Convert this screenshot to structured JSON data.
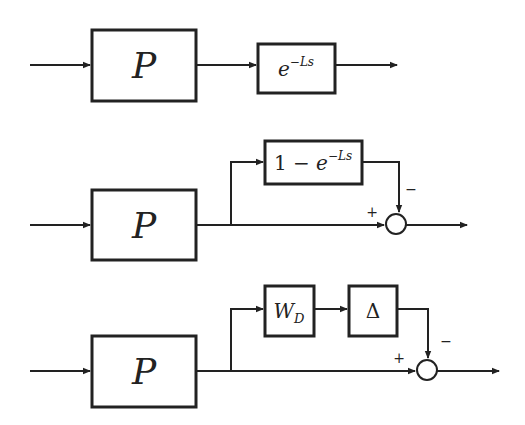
{
  "diagram": {
    "title": "",
    "rows": [
      {
        "name": "delay-model",
        "blocks": [
          {
            "id": "plant",
            "label": "P"
          },
          {
            "id": "delay",
            "label_base": "e",
            "label_sup": "−Ls"
          }
        ]
      },
      {
        "name": "additive-delay-model",
        "blocks": [
          {
            "id": "plant",
            "label": "P"
          },
          {
            "id": "delay-diff",
            "label_prefix": "1 − ",
            "label_base": "e",
            "label_sup": "−Ls"
          }
        ],
        "sum": {
          "plus": "+",
          "minus": "−"
        }
      },
      {
        "name": "uncertainty-model",
        "blocks": [
          {
            "id": "plant",
            "label": "P"
          },
          {
            "id": "weight",
            "label_base": "W",
            "label_sub": "D"
          },
          {
            "id": "delta",
            "label": "Δ"
          }
        ],
        "sum": {
          "plus": "+",
          "minus": "−"
        }
      }
    ]
  }
}
